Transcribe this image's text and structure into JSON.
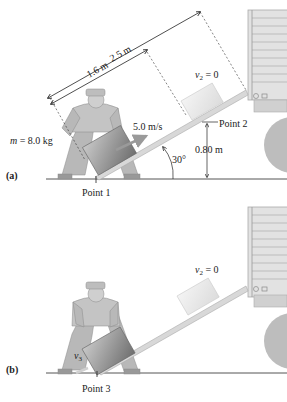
{
  "panel_a": {
    "label": "(a)",
    "mass_label": "m = 8.0 kg",
    "mass_var": "m",
    "mass_value": "= 8.0 kg",
    "speed_label": "5.0 m/s",
    "point1": "Point 1",
    "point2": "Point 2",
    "height_label": "0.80 m",
    "angle_label": "30°",
    "v2_var": "v",
    "v2_sub": "2",
    "v2_value": " = 0",
    "dim_short": "1.6 m",
    "dim_long": "2.5 m"
  },
  "panel_b": {
    "label": "(b)",
    "point3": "Point 3",
    "v2_var": "v",
    "v2_sub": "2",
    "v2_value": " = 0",
    "v3_var": "v",
    "v3_sub": "3"
  },
  "colors": {
    "ground": "#555555",
    "ramp": "#c8c8c8",
    "box_dark": "#8a8a8a",
    "box_light": "#eeeeee",
    "truck": "#d9d9d9",
    "person": "#b5b5b5",
    "arrow": "#9a9a9a"
  }
}
